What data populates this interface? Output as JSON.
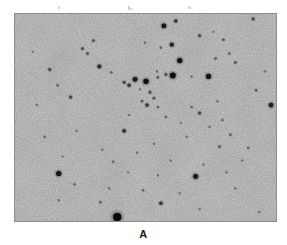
{
  "figure": {
    "caption": "A",
    "panel_label": "A",
    "kind": "astronomical-plate",
    "frame": {
      "x": 14,
      "y": 13,
      "width": 263,
      "height": 209,
      "border_color": "#8d8d8d"
    },
    "colors": {
      "page_background": "#ffffff",
      "sky_background": "#9b9b9b",
      "sky_light": "#b4b4b4",
      "sky_dark": "#7e7e7e",
      "star_core": "#141414",
      "caption_text": "#1a1a1a"
    }
  },
  "chart_data": {
    "type": "scatter",
    "title": "A",
    "xlabel": "",
    "ylabel": "",
    "xlim": [
      0,
      263
    ],
    "ylim": [
      0,
      209
    ],
    "grid": false,
    "legend": "none",
    "note": "Star positions in plate pixel coordinates relative to the frame interior; r = apparent radius in px, d = darkness 0-1 (1 = blackest core).",
    "series": [
      {
        "name": "stars",
        "points": [
          {
            "x": 162,
            "y": 7,
            "r": 1.7,
            "d": 0.72
          },
          {
            "x": 240,
            "y": 5,
            "r": 1.5,
            "d": 0.62
          },
          {
            "x": 150,
            "y": 12,
            "r": 2.4,
            "d": 0.88
          },
          {
            "x": 186,
            "y": 22,
            "r": 1.5,
            "d": 0.6
          },
          {
            "x": 79,
            "y": 27,
            "r": 1.4,
            "d": 0.52
          },
          {
            "x": 210,
            "y": 26,
            "r": 1.3,
            "d": 0.5
          },
          {
            "x": 68,
            "y": 35,
            "r": 1.5,
            "d": 0.55
          },
          {
            "x": 73,
            "y": 40,
            "r": 1.4,
            "d": 0.52
          },
          {
            "x": 131,
            "y": 29,
            "r": 1.1,
            "d": 0.42
          },
          {
            "x": 147,
            "y": 34,
            "r": 1.2,
            "d": 0.45
          },
          {
            "x": 158,
            "y": 31,
            "r": 2.1,
            "d": 0.8
          },
          {
            "x": 216,
            "y": 40,
            "r": 1.2,
            "d": 0.44
          },
          {
            "x": 166,
            "y": 47,
            "r": 2.6,
            "d": 0.9
          },
          {
            "x": 202,
            "y": 45,
            "r": 1.3,
            "d": 0.48
          },
          {
            "x": 85,
            "y": 53,
            "r": 2.0,
            "d": 0.76
          },
          {
            "x": 35,
            "y": 56,
            "r": 1.6,
            "d": 0.58
          },
          {
            "x": 222,
            "y": 49,
            "r": 1.4,
            "d": 0.52
          },
          {
            "x": 97,
            "y": 59,
            "r": 1.2,
            "d": 0.44
          },
          {
            "x": 143,
            "y": 58,
            "r": 1.1,
            "d": 0.4
          },
          {
            "x": 178,
            "y": 63,
            "r": 1.1,
            "d": 0.4
          },
          {
            "x": 121,
            "y": 66,
            "r": 2.4,
            "d": 0.85
          },
          {
            "x": 110,
            "y": 69,
            "r": 1.6,
            "d": 0.6
          },
          {
            "x": 115,
            "y": 72,
            "r": 1.8,
            "d": 0.68
          },
          {
            "x": 132,
            "y": 68,
            "r": 2.7,
            "d": 0.92
          },
          {
            "x": 144,
            "y": 64,
            "r": 1.3,
            "d": 0.48
          },
          {
            "x": 152,
            "y": 61,
            "r": 1.5,
            "d": 0.55
          },
          {
            "x": 159,
            "y": 62,
            "r": 2.9,
            "d": 0.94
          },
          {
            "x": 195,
            "y": 63,
            "r": 2.6,
            "d": 0.88
          },
          {
            "x": 43,
            "y": 72,
            "r": 1.2,
            "d": 0.44
          },
          {
            "x": 126,
            "y": 76,
            "r": 1.1,
            "d": 0.38
          },
          {
            "x": 136,
            "y": 79,
            "r": 1.5,
            "d": 0.56
          },
          {
            "x": 140,
            "y": 85,
            "r": 1.4,
            "d": 0.52
          },
          {
            "x": 128,
            "y": 88,
            "r": 1.3,
            "d": 0.48
          },
          {
            "x": 133,
            "y": 92,
            "r": 1.8,
            "d": 0.68
          },
          {
            "x": 144,
            "y": 94,
            "r": 1.2,
            "d": 0.44
          },
          {
            "x": 56,
            "y": 84,
            "r": 1.6,
            "d": 0.6
          },
          {
            "x": 22,
            "y": 92,
            "r": 1.1,
            "d": 0.4
          },
          {
            "x": 178,
            "y": 94,
            "r": 1.2,
            "d": 0.42
          },
          {
            "x": 204,
            "y": 88,
            "r": 1.1,
            "d": 0.38
          },
          {
            "x": 243,
            "y": 77,
            "r": 1.3,
            "d": 0.48
          },
          {
            "x": 258,
            "y": 92,
            "r": 2.3,
            "d": 0.84
          },
          {
            "x": 115,
            "y": 102,
            "r": 1.1,
            "d": 0.38
          },
          {
            "x": 152,
            "y": 104,
            "r": 1.2,
            "d": 0.42
          },
          {
            "x": 186,
            "y": 100,
            "r": 1.6,
            "d": 0.6
          },
          {
            "x": 167,
            "y": 110,
            "r": 1.0,
            "d": 0.36
          },
          {
            "x": 196,
            "y": 114,
            "r": 1.1,
            "d": 0.38
          },
          {
            "x": 209,
            "y": 107,
            "r": 1.2,
            "d": 0.42
          },
          {
            "x": 110,
            "y": 118,
            "r": 1.9,
            "d": 0.72
          },
          {
            "x": 62,
            "y": 118,
            "r": 1.1,
            "d": 0.38
          },
          {
            "x": 30,
            "y": 124,
            "r": 1.2,
            "d": 0.42
          },
          {
            "x": 173,
            "y": 124,
            "r": 1.1,
            "d": 0.38
          },
          {
            "x": 217,
            "y": 122,
            "r": 1.3,
            "d": 0.46
          },
          {
            "x": 140,
            "y": 131,
            "r": 1.1,
            "d": 0.38
          },
          {
            "x": 88,
            "y": 137,
            "r": 1.1,
            "d": 0.36
          },
          {
            "x": 123,
            "y": 140,
            "r": 1.1,
            "d": 0.38
          },
          {
            "x": 206,
            "y": 134,
            "r": 1.4,
            "d": 0.5
          },
          {
            "x": 235,
            "y": 135,
            "r": 1.2,
            "d": 0.42
          },
          {
            "x": 48,
            "y": 144,
            "r": 1.0,
            "d": 0.34
          },
          {
            "x": 99,
            "y": 149,
            "r": 1.2,
            "d": 0.42
          },
          {
            "x": 157,
            "y": 148,
            "r": 1.1,
            "d": 0.38
          },
          {
            "x": 190,
            "y": 152,
            "r": 1.1,
            "d": 0.38
          },
          {
            "x": 229,
            "y": 148,
            "r": 1.1,
            "d": 0.36
          },
          {
            "x": 44,
            "y": 161,
            "r": 2.6,
            "d": 0.9
          },
          {
            "x": 114,
            "y": 160,
            "r": 1.0,
            "d": 0.34
          },
          {
            "x": 144,
            "y": 163,
            "r": 1.1,
            "d": 0.36
          },
          {
            "x": 182,
            "y": 164,
            "r": 2.5,
            "d": 0.88
          },
          {
            "x": 213,
            "y": 160,
            "r": 1.1,
            "d": 0.36
          },
          {
            "x": 60,
            "y": 172,
            "r": 1.2,
            "d": 0.42
          },
          {
            "x": 95,
            "y": 176,
            "r": 1.1,
            "d": 0.38
          },
          {
            "x": 129,
            "y": 178,
            "r": 1.2,
            "d": 0.42
          },
          {
            "x": 166,
            "y": 181,
            "r": 1.1,
            "d": 0.36
          },
          {
            "x": 222,
            "y": 176,
            "r": 1.1,
            "d": 0.36
          },
          {
            "x": 44,
            "y": 188,
            "r": 1.1,
            "d": 0.38
          },
          {
            "x": 86,
            "y": 190,
            "r": 1.3,
            "d": 0.46
          },
          {
            "x": 147,
            "y": 191,
            "r": 1.8,
            "d": 0.68
          },
          {
            "x": 103,
            "y": 205,
            "r": 4.1,
            "d": 0.97
          },
          {
            "x": 186,
            "y": 197,
            "r": 1.1,
            "d": 0.36
          },
          {
            "x": 246,
            "y": 200,
            "r": 1.1,
            "d": 0.34
          },
          {
            "x": 252,
            "y": 58,
            "r": 1.1,
            "d": 0.38
          },
          {
            "x": 18,
            "y": 38,
            "r": 1.0,
            "d": 0.34
          },
          {
            "x": 200,
            "y": 18,
            "r": 1.0,
            "d": 0.34
          }
        ]
      }
    ]
  }
}
